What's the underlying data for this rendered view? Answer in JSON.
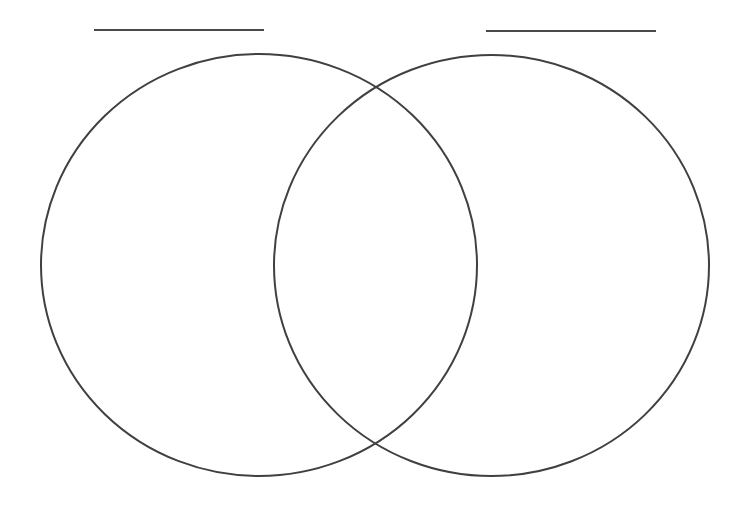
{
  "diagram": {
    "type": "venn",
    "stroke_color": "#404040",
    "background_color": "#ffffff",
    "sets": [
      {
        "name": "left-set",
        "label": "",
        "label_line": {
          "x1": 94,
          "x2": 264,
          "y": 30
        },
        "ellipse": {
          "cx": 259,
          "cy": 265,
          "rx": 218,
          "ry": 211
        }
      },
      {
        "name": "right-set",
        "label": "",
        "label_line": {
          "x1": 486,
          "x2": 656,
          "y": 31
        },
        "ellipse": {
          "cx": 491.5,
          "cy": 265.5,
          "rx": 217.5,
          "ry": 210.5
        }
      }
    ],
    "regions": {
      "left_only": "",
      "overlap": "",
      "right_only": ""
    }
  }
}
